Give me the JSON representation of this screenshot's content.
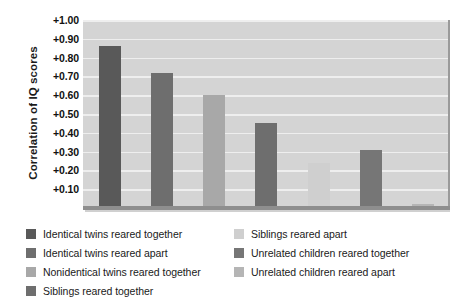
{
  "chart_data": {
    "type": "bar",
    "title": "",
    "xlabel": "",
    "ylabel": "Correlation of IQ scores",
    "ylim": [
      0,
      1.0
    ],
    "grid": true,
    "legend_position": "bottom",
    "y_ticks": [
      "+1.00",
      "+0.90",
      "+0.80",
      "+0.70",
      "+0.60",
      "+0.50",
      "+0.40",
      "+0.30",
      "+0.20",
      "+0.10"
    ],
    "y_tick_values": [
      1.0,
      0.9,
      0.8,
      0.7,
      0.6,
      0.5,
      0.4,
      0.3,
      0.2,
      0.1
    ],
    "categories": [
      "Identical twins reared together",
      "Identical twins reared apart",
      "Nonidentical twins reared together",
      "Siblings reared together",
      "Siblings reared apart",
      "Unrelated children reared together",
      "Unrelated children reared apart"
    ],
    "values": [
      0.86,
      0.72,
      0.6,
      0.45,
      0.24,
      0.31,
      0.02
    ],
    "colors": [
      "#595959",
      "#6e6e6e",
      "#a8a8a8",
      "#6e6e6e",
      "#cfcfcf",
      "#767676",
      "#b5b5b5"
    ]
  },
  "legend": {
    "left_column": [
      {
        "label": "Identical twins reared together",
        "color": "#595959"
      },
      {
        "label": "Identical twins reared apart",
        "color": "#6e6e6e"
      },
      {
        "label": "Nonidentical twins reared together",
        "color": "#a8a8a8"
      },
      {
        "label": "Siblings reared together",
        "color": "#6e6e6e"
      }
    ],
    "right_column": [
      {
        "label": "Siblings reared apart",
        "color": "#cfcfcf"
      },
      {
        "label": "Unrelated children reared together",
        "color": "#767676"
      },
      {
        "label": "Unrelated children reared apart",
        "color": "#b5b5b5"
      }
    ]
  }
}
